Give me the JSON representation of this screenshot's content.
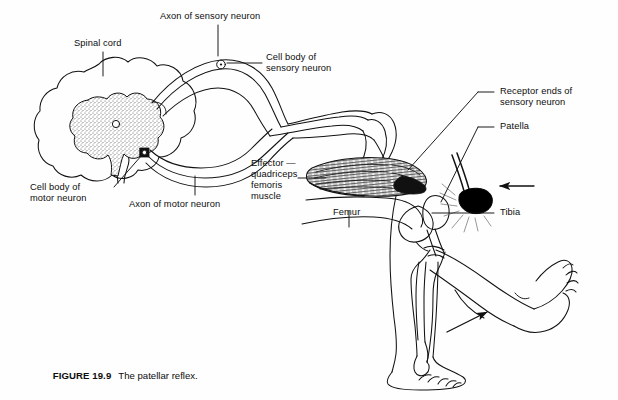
{
  "figure": {
    "number": "FIGURE 19.9",
    "caption": "The patellar reflex.",
    "style": "black-and-white-line-drawing"
  },
  "colors": {
    "background": "#fefefe",
    "ink": "#111111",
    "gray_matter_fill": "#ffffff",
    "gray_matter_stipple": "#4a4a4a",
    "hammer_fill": "#000000",
    "muscle_hatch": "#1a1a1a"
  },
  "labels": {
    "spinal_cord": "Spinal cord",
    "axon_sensory": "Axon of sensory neuron",
    "cell_body_sensory_l1": "Cell body of",
    "cell_body_sensory_l2": "sensory neuron",
    "cell_body_motor_l1": "Cell body of",
    "cell_body_motor_l2": "motor neuron",
    "axon_motor": "Axon of motor neuron",
    "effector_l1": "Effector —",
    "effector_l2": "quadriceps",
    "effector_l3": "femoris",
    "effector_l4": "muscle",
    "femur": "Femur",
    "receptor_ends_l1": "Receptor ends of",
    "receptor_ends_l2": "sensory neuron",
    "patella": "Patella",
    "tibia": "Tibia"
  },
  "structures": [
    "spinal cord cross-section with butterfly-shaped gray matter",
    "central canal",
    "dorsal root with sensory cell body ganglion",
    "ventral root with motor axon",
    "spinal nerve bundle to thigh",
    "quadriceps femoris muscle",
    "femur",
    "patella",
    "patellar tendon",
    "tibia",
    "fibula",
    "reflex hammer striking tendon",
    "hanging leg",
    "extended kicking leg",
    "motion arrow at foot"
  ]
}
